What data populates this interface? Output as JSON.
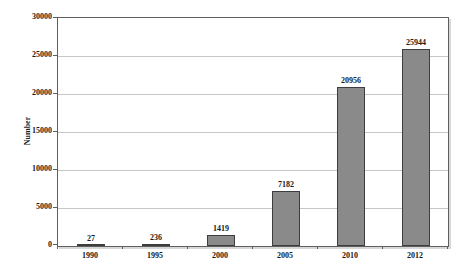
{
  "chart_data": {
    "type": "bar",
    "title": "",
    "categories": [
      "1990",
      "1995",
      "2000",
      "2005",
      "2010",
      "2012"
    ],
    "values": [
      27,
      236,
      1419,
      7182,
      20956,
      25944
    ],
    "data_labels": [
      "27",
      "236",
      "1419",
      "7182",
      "20956",
      "25944"
    ],
    "xlabel": "",
    "ylabel": "Number",
    "ylim": [
      0,
      30000
    ],
    "ytick_step": 5000,
    "ytick_labels": [
      "0",
      "5000",
      "10000",
      "15000",
      "20000",
      "25000",
      "30000"
    ],
    "grid": "horizontal",
    "legend": "none",
    "colors": {
      "bar_fill": "#8a8a8a",
      "bar_border": "#3d3d3d",
      "gridline": "#c6c6c6",
      "frame": "#5f5f5f",
      "tick": "#5f5f5f",
      "text": "#1a1a1a",
      "background": "#ffffff",
      "shadow": "#d8d8d8"
    }
  }
}
